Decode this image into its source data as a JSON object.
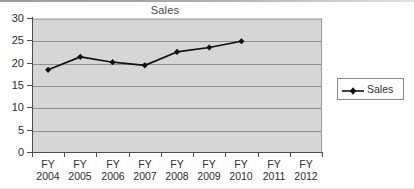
{
  "chart_data": {
    "type": "line",
    "title": "Sales",
    "xlabel": "",
    "ylabel": "",
    "categories": [
      "FY 2004",
      "FY 2005",
      "FY 2006",
      "FY 2007",
      "FY 2008",
      "FY 2009",
      "FY 2010",
      "FY 2011",
      "FY 2012"
    ],
    "category_lines": [
      {
        "line1": "FY",
        "line2": "2004"
      },
      {
        "line1": "FY",
        "line2": "2005"
      },
      {
        "line1": "FY",
        "line2": "2006"
      },
      {
        "line1": "FY",
        "line2": "2007"
      },
      {
        "line1": "FY",
        "line2": "2008"
      },
      {
        "line1": "FY",
        "line2": "2009"
      },
      {
        "line1": "FY",
        "line2": "2010"
      },
      {
        "line1": "FY",
        "line2": "2011"
      },
      {
        "line1": "FY",
        "line2": "2012"
      }
    ],
    "series": [
      {
        "name": "Sales",
        "values": [
          18.4,
          21.3,
          20.1,
          19.4,
          22.4,
          23.4,
          24.8,
          null,
          null
        ],
        "color": "#111111",
        "marker": "diamond"
      }
    ],
    "ylim": [
      0,
      30
    ],
    "yticks": [
      0,
      5,
      10,
      15,
      20,
      25,
      30
    ],
    "ytick_labels": [
      "0",
      "5",
      "10",
      "15",
      "20",
      "25",
      "30"
    ],
    "grid": true,
    "grid_axis": "y",
    "legend": {
      "position": "right",
      "entries": [
        {
          "label": "Sales",
          "color": "#111111",
          "marker": "diamond"
        }
      ]
    },
    "plot_background": "#d6d6d6",
    "figure_background": "#fdfdfd"
  }
}
